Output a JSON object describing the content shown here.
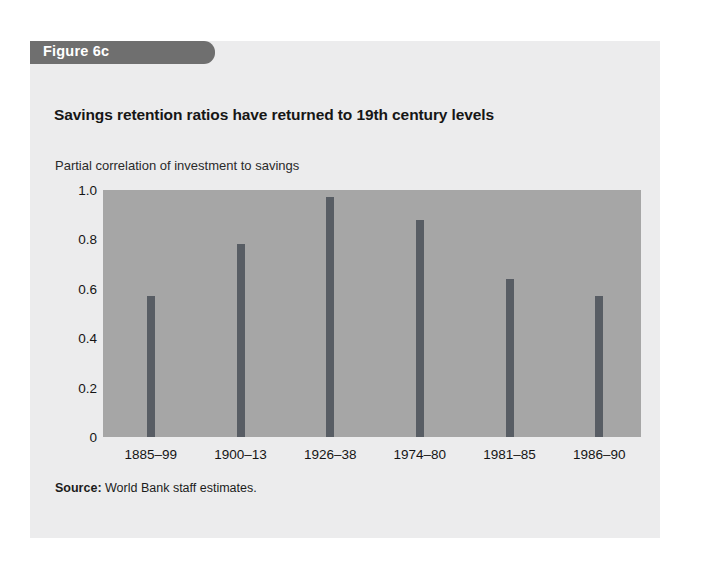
{
  "figure": {
    "tab_label": "Figure 6c",
    "title": "Savings retention ratios have returned to 19th century levels",
    "source_label": "Source:",
    "source_text": "World Bank staff estimates."
  },
  "colors": {
    "page_background": "#ffffff",
    "card_background": "#ececed",
    "tab_background": "#6f6f6f",
    "tab_text": "#ffffff",
    "plot_background": "#a6a6a6",
    "bar_color": "#585d64",
    "text_color": "#151515"
  },
  "chart_data": {
    "type": "bar",
    "title": "Savings retention ratios have returned to 19th century levels",
    "subtitle": "Partial correlation of investment to savings",
    "categories": [
      "1885–99",
      "1900–13",
      "1926–38",
      "1974–80",
      "1981–85",
      "1986–90"
    ],
    "values": [
      0.57,
      0.78,
      0.97,
      0.88,
      0.64,
      0.57
    ],
    "xlabel": "",
    "ylabel": "Partial correlation of investment to savings",
    "ylim": [
      0,
      1.0
    ],
    "yticks": [
      0,
      0.2,
      0.4,
      0.6,
      0.8,
      1.0
    ],
    "ytick_labels": [
      "0",
      "0.2",
      "0.4",
      "0.6",
      "0.8",
      "1.0"
    ],
    "grid": false,
    "legend": "none"
  }
}
